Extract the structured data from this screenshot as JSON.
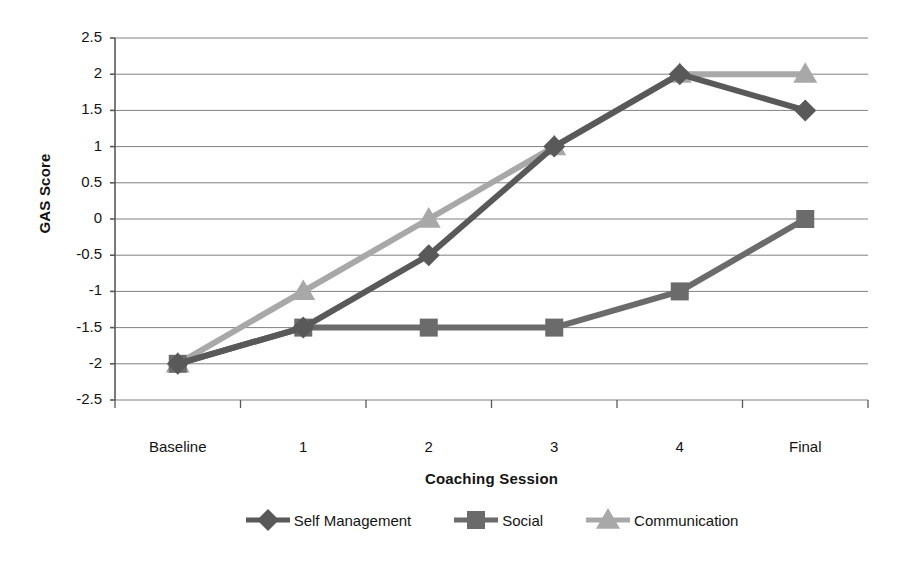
{
  "chart_data": {
    "type": "line",
    "title": "",
    "xlabel": "Coaching Session",
    "ylabel": "GAS Score",
    "categories": [
      "Baseline",
      "1",
      "2",
      "3",
      "4",
      "Final"
    ],
    "ylim": [
      -2.5,
      2.5
    ],
    "ytick_labels": [
      "2.5",
      "2",
      "1.5",
      "1",
      "0.5",
      "0",
      "-0.5",
      "-1",
      "-1.5",
      "-2",
      "-2.5"
    ],
    "ytick_values": [
      2.5,
      2,
      1.5,
      1,
      0.5,
      0,
      -0.5,
      -1,
      -1.5,
      -2,
      -2.5
    ],
    "grid": "horizontal",
    "legend_position": "bottom",
    "series": [
      {
        "name": "Self Management",
        "marker": "diamond",
        "color": "#595959",
        "values": [
          -2,
          -1.5,
          -0.5,
          1,
          2,
          1.5
        ]
      },
      {
        "name": "Social",
        "marker": "square",
        "color": "#6b6b6b",
        "values": [
          -2,
          -1.5,
          -1.5,
          -1.5,
          -1,
          0
        ]
      },
      {
        "name": "Communication",
        "marker": "triangle",
        "color": "#a8a8a8",
        "values": [
          -2,
          -1,
          0,
          1,
          2,
          2
        ]
      }
    ]
  },
  "axes": {
    "y_title": "GAS Score",
    "x_title": "Coaching Session"
  },
  "colors": {
    "gridline": "#808080",
    "axis": "#595959",
    "text": "#141414"
  }
}
